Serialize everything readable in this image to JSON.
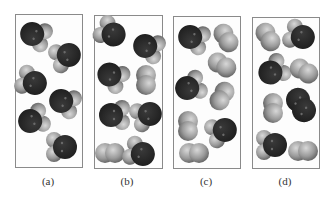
{
  "figure": {
    "colors": {
      "oxygen": "#1e1e1e",
      "hydrogen": "#9a9a9a",
      "frame": "#8a8a8a"
    },
    "panels": [
      {
        "id": "a",
        "label": "(a)",
        "frame": {
          "x": 15,
          "y": 14,
          "w": 68,
          "h": 154
        },
        "label_pos": {
          "x": 48,
          "y": 175
        },
        "molecules": [
          {
            "type": "H2O",
            "x": 35,
            "y": 35,
            "angle": 200
          },
          {
            "type": "H2O",
            "x": 66,
            "y": 56,
            "angle": 340
          },
          {
            "type": "H2O",
            "x": 32,
            "y": 82,
            "angle": 20
          },
          {
            "type": "H2O",
            "x": 64,
            "y": 102,
            "angle": 200
          },
          {
            "type": "H2O",
            "x": 33,
            "y": 120,
            "angle": 160
          },
          {
            "type": "H2O",
            "x": 62,
            "y": 147,
            "angle": 0
          }
        ]
      },
      {
        "id": "b",
        "label": "(b)",
        "frame": {
          "x": 94,
          "y": 15,
          "w": 69,
          "h": 154
        },
        "label_pos": {
          "x": 127,
          "y": 175
        },
        "molecules": [
          {
            "type": "H2O",
            "x": 111,
            "y": 33,
            "angle": 30
          },
          {
            "type": "H2O",
            "x": 148,
            "y": 47,
            "angle": 200
          },
          {
            "type": "H2O",
            "x": 112,
            "y": 76,
            "angle": 210
          },
          {
            "type": "H2",
            "x": 146,
            "y": 80,
            "angle": 90
          },
          {
            "type": "H2O",
            "x": 114,
            "y": 115,
            "angle": 180
          },
          {
            "type": "H2O",
            "x": 147,
            "y": 115,
            "angle": 340
          },
          {
            "type": "H2",
            "x": 110,
            "y": 153,
            "angle": 0
          },
          {
            "type": "H2O",
            "x": 140,
            "y": 153,
            "angle": 20
          }
        ]
      },
      {
        "id": "c",
        "label": "(c)",
        "frame": {
          "x": 173,
          "y": 16,
          "w": 68,
          "h": 153
        },
        "label_pos": {
          "x": 206,
          "y": 175
        },
        "molecules": [
          {
            "type": "H2O",
            "x": 193,
            "y": 38,
            "angle": 200
          },
          {
            "type": "H2",
            "x": 226,
            "y": 38,
            "angle": 60
          },
          {
            "type": "H2",
            "x": 222,
            "y": 65,
            "angle": 30
          },
          {
            "type": "H2O",
            "x": 190,
            "y": 87,
            "angle": 160
          },
          {
            "type": "H2",
            "x": 222,
            "y": 96,
            "angle": 120
          },
          {
            "type": "H2",
            "x": 188,
            "y": 126,
            "angle": 90
          },
          {
            "type": "H2O",
            "x": 222,
            "y": 131,
            "angle": 340
          },
          {
            "type": "H2",
            "x": 194,
            "y": 153,
            "angle": 0
          }
        ]
      },
      {
        "id": "d",
        "label": "(d)",
        "frame": {
          "x": 252,
          "y": 17,
          "w": 68,
          "h": 152
        },
        "label_pos": {
          "x": 285,
          "y": 175
        },
        "molecules": [
          {
            "type": "H2",
            "x": 268,
            "y": 37,
            "angle": 60
          },
          {
            "type": "H2O",
            "x": 300,
            "y": 36,
            "angle": 20
          },
          {
            "type": "H2O",
            "x": 273,
            "y": 71,
            "angle": 150
          },
          {
            "type": "H2",
            "x": 304,
            "y": 71,
            "angle": 30
          },
          {
            "type": "H2",
            "x": 273,
            "y": 108,
            "angle": 90
          },
          {
            "type": "O2",
            "x": 301,
            "y": 105,
            "angle": 60
          },
          {
            "type": "H2O",
            "x": 272,
            "y": 145,
            "angle": 0
          },
          {
            "type": "H2",
            "x": 303,
            "y": 151,
            "angle": 0
          }
        ]
      }
    ]
  }
}
